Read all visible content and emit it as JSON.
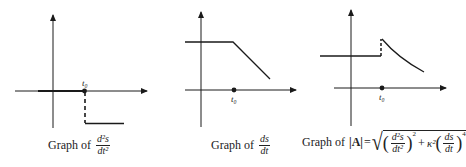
{
  "figures": [
    {
      "id": "graph-1",
      "caption_prefix": "Graph of",
      "caption_num": "d²s",
      "caption_den": "dt²",
      "t0_label": "t₀",
      "description": "Second derivative: zero for t < t0, negative constant after t0 (jump discontinuity shown with dashed line)"
    },
    {
      "id": "graph-2",
      "caption_prefix": "Graph of",
      "caption_num": "ds",
      "caption_den": "dt",
      "t0_label": "t₀",
      "description": "Speed: constant positive before t0, linearly decreasing after t0"
    },
    {
      "id": "graph-3",
      "caption_prefix": "Graph of",
      "caption_abs": "|A|",
      "caption_eq": "=",
      "caption_term1_num": "d²s",
      "caption_term1_den": "dt²",
      "caption_exp1": "2",
      "caption_plus": "+",
      "caption_kappa": "κ²",
      "caption_term2_num": "ds",
      "caption_term2_den": "dt",
      "caption_exp2": "4",
      "t0_label": "t₀",
      "description": "Acceleration magnitude: constant before t0, jumps up at t0 (dashed), then decreases along a curve"
    }
  ],
  "colors": {
    "ink": "#1a1a1a",
    "background": "#ffffff"
  }
}
